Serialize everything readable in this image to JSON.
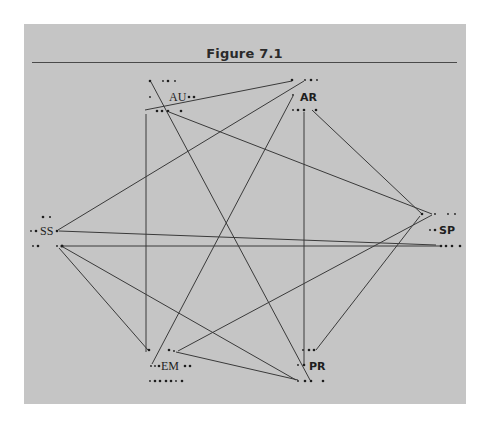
{
  "figure": {
    "title": "Figure 7.1"
  },
  "colors": {
    "background": "#ffffff",
    "panel": "#c5c5c5",
    "ink": "#2e2e2e"
  },
  "nodes": [
    {
      "id": "AU",
      "label": "AU",
      "x": 180,
      "y": 97
    },
    {
      "id": "AR",
      "label": "AR",
      "x": 308,
      "y": 97
    },
    {
      "id": "SS",
      "label": "SS",
      "x": 47,
      "y": 230
    },
    {
      "id": "SP",
      "label": "SP",
      "x": 447,
      "y": 230
    },
    {
      "id": "EM",
      "label": "EM",
      "x": 172,
      "y": 366
    },
    {
      "id": "PR",
      "label": "PR",
      "x": 313,
      "y": 366
    }
  ],
  "edges": [
    {
      "from": "AU",
      "to": "PR"
    },
    {
      "from": "AU",
      "to": "AR"
    },
    {
      "from": "AR",
      "to": "SS"
    },
    {
      "from": "AU",
      "to": "SP"
    },
    {
      "from": "AU",
      "to": "EM"
    },
    {
      "from": "AR",
      "to": "EM"
    },
    {
      "from": "AR",
      "to": "PR"
    },
    {
      "from": "AR",
      "to": "SP"
    },
    {
      "from": "SS",
      "to": "SP"
    },
    {
      "from": "SS",
      "to": "SP"
    },
    {
      "from": "SS",
      "to": "EM"
    },
    {
      "from": "SS",
      "to": "PR"
    },
    {
      "from": "EM",
      "to": "SP"
    },
    {
      "from": "EM",
      "to": "PR"
    },
    {
      "from": "PR",
      "to": "SP"
    }
  ]
}
